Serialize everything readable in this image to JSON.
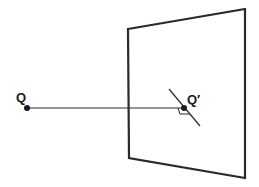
{
  "diagram": {
    "type": "projection-of-point-onto-plane",
    "labels": {
      "point": "Q",
      "projection": "Q′"
    },
    "colors": {
      "stroke": "#2a2a2a",
      "background": "#ffffff"
    },
    "elements": [
      "plane (quadrilateral in perspective)",
      "point Q",
      "perpendicular segment from Q to plane",
      "foot point Q′ on plane",
      "line in plane through Q′",
      "right-angle marker at Q′"
    ]
  }
}
